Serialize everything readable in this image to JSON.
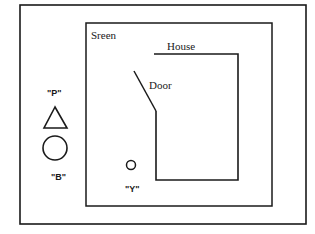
{
  "diagram": {
    "type": "scene-layout",
    "colors": {
      "stroke": "#1a1a1a",
      "background": "#ffffff"
    },
    "outer_frame": {
      "x": 20,
      "y": 5,
      "w": 286,
      "h": 219
    },
    "screen": {
      "label": "Sreen",
      "x": 86,
      "y": 23,
      "w": 186,
      "h": 183
    },
    "house": {
      "label": "House",
      "top_y": 54,
      "left_x": 156,
      "right_x": 238,
      "bottom_y": 180,
      "top_start_x": 154,
      "left_start_y": 111
    },
    "door": {
      "label": "Door",
      "x1": 134,
      "y1": 71,
      "x2": 156,
      "y2": 111
    },
    "objects": [
      {
        "id": "P",
        "label": "\"P\"",
        "shape": "triangle"
      },
      {
        "id": "B",
        "label": "\"B\"",
        "shape": "circle"
      },
      {
        "id": "Y",
        "label": "\"Y\"",
        "shape": "small-circle"
      }
    ]
  }
}
